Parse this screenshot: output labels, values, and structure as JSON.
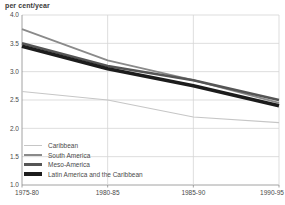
{
  "page": {
    "unit_label": "per cent/year"
  },
  "colors": {
    "background": "#ffffff",
    "gridline": "#d4d4d4",
    "axis": "#8c8c8c",
    "tick_text": "#4a4a4a",
    "title_text": "#3a3a3a"
  },
  "chart_data": {
    "type": "line",
    "title": "per cent/year",
    "xlabel": "",
    "ylabel": "per cent/year",
    "ylim": [
      1.0,
      4.0
    ],
    "ytick_step": 0.5,
    "ytick_labels": [
      "4.0",
      "3.5",
      "3.0",
      "2.5",
      "2.0",
      "1.5",
      "1.0"
    ],
    "grid": true,
    "legend_position": "inside-bottom-left",
    "categories": [
      "1975-80",
      "1980-85",
      "1985-90",
      "1990-95"
    ],
    "series": [
      {
        "name": "Caribbean",
        "color": "#c6c6c6",
        "line_width": 1.2,
        "values": [
          2.65,
          2.5,
          2.2,
          2.1
        ]
      },
      {
        "name": "South America",
        "color": "#8a8a8a",
        "line_width": 1.8,
        "values": [
          3.75,
          3.2,
          2.85,
          2.45
        ]
      },
      {
        "name": "Meso-America",
        "color": "#555555",
        "line_width": 2.6,
        "values": [
          3.5,
          3.1,
          2.85,
          2.5
        ]
      },
      {
        "name": "Latin America and the Caribbean",
        "color": "#1c1c1c",
        "line_width": 3.6,
        "values": [
          3.45,
          3.05,
          2.75,
          2.4
        ]
      }
    ]
  }
}
